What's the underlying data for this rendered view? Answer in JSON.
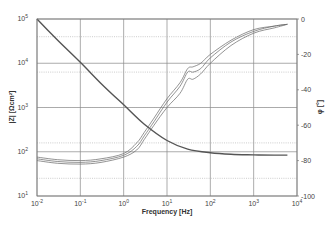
{
  "chart_data": {
    "type": "line",
    "title": "",
    "xlabel": "Frequency [Hz]",
    "ylabel": "|Z| [Ωcm²]",
    "y2label": "φ [°]",
    "xscale": "log",
    "yscale": "log",
    "xlim": [
      0.01,
      10000
    ],
    "ylim": [
      10,
      100000
    ],
    "y2lim": [
      -100,
      0
    ],
    "grid": true,
    "legend": null,
    "x_ticks": [
      "10^-2",
      "10^-1",
      "10^0",
      "10^1",
      "10^2",
      "10^3",
      "10^4"
    ],
    "y_ticks": [
      "10^1",
      "10^2",
      "10^3",
      "10^4",
      "10^5"
    ],
    "y2_ticks": [
      "0",
      "-20",
      "-40",
      "-60",
      "-80",
      "-100"
    ],
    "series": [
      {
        "name": "|Z| (magnitude, left axis)",
        "axis": "left",
        "x": [
          0.01,
          0.03,
          0.1,
          0.3,
          1,
          3,
          10,
          30,
          100,
          300,
          1000,
          3000,
          6000
        ],
        "values": [
          100000,
          33000,
          10500,
          3500,
          1150,
          420,
          180,
          115,
          95,
          88,
          85,
          84,
          84
        ]
      },
      {
        "name": "Phase φ run 1 (right axis)",
        "axis": "right",
        "x": [
          0.01,
          0.03,
          0.1,
          0.3,
          1,
          2,
          3,
          5,
          10,
          20,
          30,
          40,
          60,
          100,
          300,
          1000,
          3000,
          6000
        ],
        "values": [
          -79,
          -80.5,
          -81,
          -80,
          -77,
          -72,
          -66,
          -58,
          -47,
          -38,
          -30,
          -30,
          -28,
          -22,
          -13,
          -7,
          -4,
          -3
        ]
      },
      {
        "name": "Phase φ run 2 (right axis)",
        "axis": "right",
        "x": [
          0.01,
          0.03,
          0.1,
          0.3,
          1,
          2,
          3,
          5,
          10,
          20,
          30,
          40,
          60,
          100,
          300,
          1000,
          3000,
          6000
        ],
        "values": [
          -78,
          -79.5,
          -80,
          -79,
          -76,
          -70,
          -64,
          -56,
          -45,
          -36,
          -28,
          -27,
          -25,
          -20,
          -12,
          -6,
          -4,
          -3
        ]
      },
      {
        "name": "Phase φ run 3 (right axis)",
        "axis": "right",
        "x": [
          0.01,
          0.03,
          0.1,
          0.3,
          1,
          2,
          3,
          5,
          10,
          20,
          30,
          40,
          60,
          100,
          300,
          1000,
          3000,
          6000
        ],
        "values": [
          -80,
          -81.5,
          -82,
          -81,
          -78,
          -74,
          -68,
          -60,
          -50,
          -42,
          -34,
          -34,
          -31,
          -25,
          -15,
          -8,
          -5,
          -3
        ]
      }
    ]
  }
}
